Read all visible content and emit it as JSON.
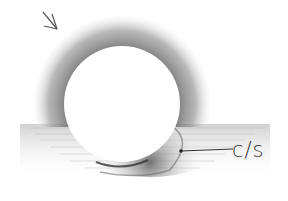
{
  "drawing": {
    "subject": "pencil sketch of a sphere with form shadow and cast shadow",
    "annotation_label": "c/s",
    "light_direction_arrow": "arrow-down-right",
    "colors": {
      "paper": "#ffffff",
      "graphite_light": "#c8c8c8",
      "graphite_mid": "#8a8a8a",
      "graphite_dark": "#3a3a3a"
    }
  }
}
